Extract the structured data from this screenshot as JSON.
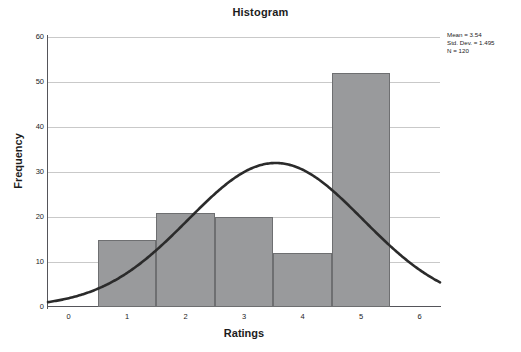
{
  "chart_data": {
    "type": "bar",
    "title": "Histogram",
    "xlabel": "Ratings",
    "ylabel": "Frequency",
    "categories": [
      "1",
      "2",
      "3",
      "4",
      "5"
    ],
    "bin_centers": [
      1,
      2,
      3,
      4,
      5
    ],
    "bin_width": 1,
    "values": [
      15,
      21,
      20,
      12,
      52
    ],
    "xlim": [
      -0.35,
      6.35
    ],
    "ylim": [
      0,
      60
    ],
    "xticks": [
      0,
      1,
      2,
      3,
      4,
      5,
      6
    ],
    "yticks": [
      0,
      10,
      20,
      30,
      40,
      50,
      60
    ],
    "grid": "horizontal",
    "legend": "none",
    "overlay": {
      "type": "normal-curve",
      "mean": 3.54,
      "std_dev": 1.495,
      "n": 120,
      "peak_value": 32
    },
    "annotations": {
      "mean": "Mean = 3.54",
      "std_dev": "Std. Dev. = 1.495",
      "n": "N = 120"
    },
    "colors": {
      "bar_fill": "#999a9c",
      "bar_edge": "#6e6f71",
      "curve": "#2b2b2b",
      "grid": "#c9c9c9",
      "axis": "#55555a",
      "background": "#ffffff",
      "text": "#1c1c1c"
    }
  }
}
